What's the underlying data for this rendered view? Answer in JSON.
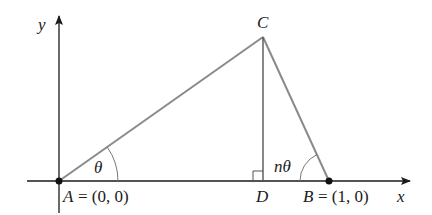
{
  "diagram": {
    "type": "geometry-triangle-on-axes",
    "axes": {
      "x_label": "x",
      "y_label": "y",
      "color": "#1a1a1a"
    },
    "triangle": {
      "edge_color": "#8a8a8a",
      "altitude_color": "#555555"
    },
    "points": {
      "A": {
        "name": "A",
        "coords_text": "= (0, 0)"
      },
      "B": {
        "name": "B",
        "coords_text": "= (1, 0)"
      },
      "C": {
        "name": "C"
      },
      "D": {
        "name": "D"
      }
    },
    "angles": {
      "at_A": "θ",
      "at_B": "nθ"
    },
    "annotations": {
      "right_angle_at": "D"
    }
  }
}
